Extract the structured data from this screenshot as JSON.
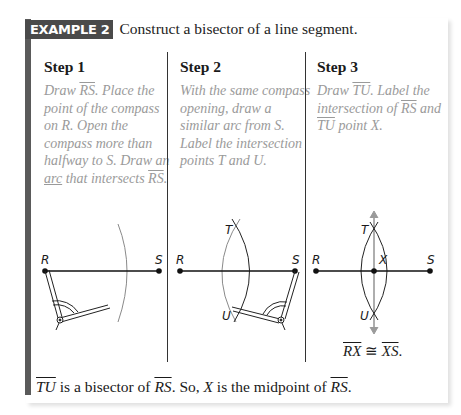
{
  "header": {
    "badge": "EXAMPLE 2",
    "title": "Construct a bisector of a line segment."
  },
  "steps": [
    {
      "title": "Step 1",
      "text_parts": [
        "Draw ",
        "RS",
        ". Place the point of the compass on R. Open the compass more than halfway to S. Draw an ",
        "arc",
        " that intersects ",
        "RS",
        "."
      ],
      "labels": {
        "r": "R",
        "s": "S"
      }
    },
    {
      "title": "Step 2",
      "text": "With the same compass opening, draw a similar arc from S. Label the intersection points T and U.",
      "labels": {
        "r": "R",
        "s": "S",
        "t": "T",
        "u": "U"
      }
    },
    {
      "title": "Step 3",
      "text_parts": [
        "Draw ",
        "TU",
        ". Label the intersection of ",
        "RS",
        " and ",
        "TU",
        " point X."
      ],
      "labels": {
        "r": "R",
        "s": "S",
        "t": "T",
        "u": "U",
        "x": "X"
      },
      "congruence": {
        "left": "RX",
        "symbol": " ≅ ",
        "right": "XS",
        "end": "."
      }
    }
  ],
  "conclusion": {
    "line": "TU",
    "part1": " is a bisector of ",
    "seg1": "RS",
    "part2": ". So, ",
    "point": "X",
    "part3": " is the midpoint of ",
    "seg2": "RS",
    "end": "."
  },
  "colors": {
    "badge_bg": "#4a4a4a",
    "instruction_text": "#9a9a9a",
    "arc": "#8a8a8a",
    "bisector_line": "#9a9a9a"
  }
}
